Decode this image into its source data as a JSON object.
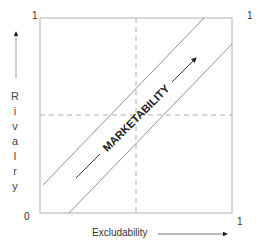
{
  "diagram": {
    "x_axis": {
      "label": "Excludability",
      "min_label": "0",
      "max_label": "1"
    },
    "y_axis": {
      "label": "Rivalry",
      "letters": [
        "R",
        "i",
        "v",
        "a",
        "l",
        "r",
        "y"
      ],
      "max_label": "1"
    },
    "center_label": "MARKETABILITY",
    "colors": {
      "frame": "#b0b0b0",
      "lines": "#666666",
      "dashed": "#999999",
      "text": "#333333"
    }
  }
}
